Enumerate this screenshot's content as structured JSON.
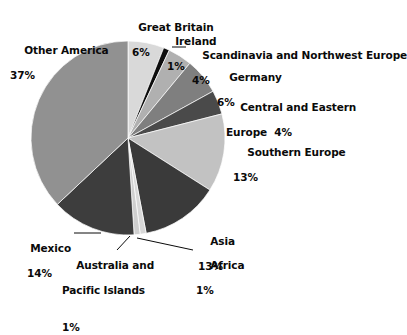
{
  "chart_data": {
    "type": "pie",
    "title": "",
    "subtitle": "",
    "xlabel": "",
    "ylabel": "",
    "legend_position": "none",
    "grid": false,
    "units": "percent",
    "start_angle_deg": 0,
    "direction": "clockwise",
    "categories": [
      "Great Britain",
      "Ireland",
      "Scandinavia and Northwest Europe",
      "Germany",
      "Central and Eastern Europe",
      "Southern Europe",
      "Asia",
      "Africa",
      "Australia and Pacific Islands",
      "Mexico",
      "Other America"
    ],
    "values": [
      6,
      1,
      4,
      6,
      4,
      13,
      13,
      1,
      1,
      14,
      37
    ],
    "colors": [
      "#d9d9d9",
      "#0d0d0d",
      "#b0b0b0",
      "#7f7f7f",
      "#4a4a4a",
      "#c2c2c2",
      "#3a3a3a",
      "#d8d8d8",
      "#cfcfcf",
      "#3d3d3d",
      "#919191"
    ],
    "slices": [
      {
        "label": "Great Britain",
        "value": 6,
        "display": "6%",
        "color": "#d9d9d9"
      },
      {
        "label": "Ireland",
        "value": 1,
        "display": "1%",
        "color": "#0d0d0d"
      },
      {
        "label": "Scandinavia and Northwest Europe",
        "value": 4,
        "display": "4%",
        "color": "#b0b0b0"
      },
      {
        "label": "Germany",
        "value": 6,
        "display": "6%",
        "color": "#7f7f7f"
      },
      {
        "label": "Central and Eastern Europe",
        "value": 4,
        "display": "4%",
        "color": "#4a4a4a"
      },
      {
        "label": "Southern Europe",
        "value": 13,
        "display": "13%",
        "color": "#c2c2c2"
      },
      {
        "label": "Asia",
        "value": 13,
        "display": "13%",
        "color": "#3a3a3a"
      },
      {
        "label": "Africa",
        "value": 1,
        "display": "1%",
        "color": "#d8d8d8"
      },
      {
        "label": "Australia and Pacific Islands",
        "value": 1,
        "display": "1%",
        "color": "#cfcfcf"
      },
      {
        "label": "Mexico",
        "value": 14,
        "display": "14%",
        "color": "#3d3d3d"
      },
      {
        "label": "Other America",
        "value": 37,
        "display": "37%",
        "color": "#919191"
      }
    ]
  },
  "labels": {
    "other_america": {
      "name": "Other America",
      "pct": "37%"
    },
    "great_britain": {
      "name": "Great Britain",
      "pct": "6%"
    },
    "ireland": {
      "name": "Ireland",
      "pct": "1%"
    },
    "scandinavia": {
      "name": "Scandinavia and Northwest Europe",
      "pct": "4%"
    },
    "germany": {
      "name": "Germany",
      "pct": "6%"
    },
    "central_eastern": {
      "name": "Central and Eastern",
      "name2": "Europe  4%"
    },
    "southern_europe": {
      "name": "Southern Europe",
      "pct": "13%"
    },
    "asia": {
      "name": "Asia",
      "pct": "13%"
    },
    "africa": {
      "name": "Africa",
      "pct": "1%"
    },
    "australia": {
      "name": "Australia and",
      "name2": "Pacific Islands",
      "pct": "1%"
    },
    "mexico": {
      "name": "Mexico",
      "pct": "14%"
    }
  }
}
